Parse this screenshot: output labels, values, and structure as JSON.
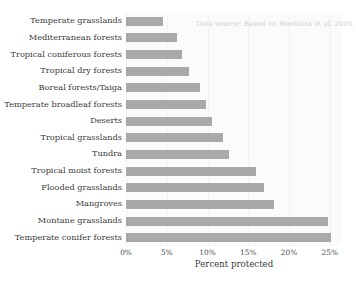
{
  "chart_data": {
    "type": "bar",
    "orientation": "horizontal",
    "title": "",
    "xlabel": "Percent protected",
    "ylabel": "",
    "xlim": [
      0,
      26.5
    ],
    "grid": true,
    "legend": false,
    "categories": [
      "Temperate grasslands",
      "Mediterranean forests",
      "Tropical coniferous forests",
      "Tropical dry forests",
      "Boreal forests/Taiga",
      "Temperate broadleaf forests",
      "Deserts",
      "Tropical grasslands",
      "Tundra",
      "Tropical moist forests",
      "Flooded grasslands",
      "Mangroves",
      "Montane grasslands",
      "Temperate conifer forests"
    ],
    "values": [
      4.6,
      6.2,
      6.9,
      7.7,
      9.1,
      9.8,
      10.5,
      11.9,
      12.6,
      15.9,
      16.9,
      18.1,
      24.8,
      25.2
    ],
    "xticks": [
      0,
      5,
      10,
      15,
      20,
      25
    ],
    "xtick_labels": [
      "0%",
      "5%",
      "10%",
      "15%",
      "20%",
      "25%"
    ],
    "annotations": [
      {
        "name": "data-source-note",
        "text": "Data source: Based on Hoekstra et al. 2005."
      }
    ],
    "colors": {
      "bar": "#a9a9a9",
      "plot_background": "#fbfbfb",
      "figure_background": "#ffffff",
      "gridline": "#f2f2f2",
      "label_text": "#3a3a3a",
      "annotation_text": "#cfcfcf"
    }
  }
}
